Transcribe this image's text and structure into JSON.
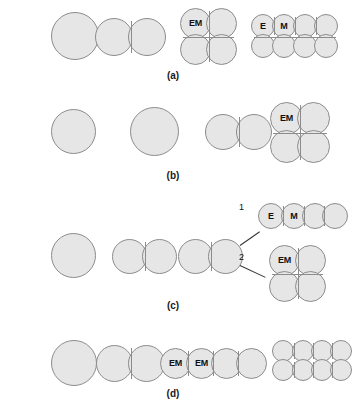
{
  "figure": {
    "background_color": "#ffffff",
    "cell_fill_color": "#e6e6e6",
    "cell_stroke_color": "#8c8c8c",
    "label_text_color": "#111111"
  },
  "rows": [
    {
      "caption": "(a)",
      "stages": [
        {
          "name": "one-cell",
          "labels": []
        },
        {
          "name": "two-cell",
          "labels": []
        },
        {
          "name": "four-cell-quad",
          "labels": [
            "EM"
          ]
        },
        {
          "name": "eight-cell-cluster",
          "labels": [
            "E",
            "M"
          ]
        }
      ]
    },
    {
      "caption": "(b)",
      "stages": [
        {
          "name": "one-cell",
          "labels": []
        },
        {
          "name": "one-cell",
          "labels": []
        },
        {
          "name": "two-cell",
          "labels": []
        },
        {
          "name": "four-cell-quad",
          "labels": [
            "EM"
          ]
        }
      ]
    },
    {
      "caption": "(c)",
      "stages": [
        {
          "name": "one-cell",
          "labels": []
        },
        {
          "name": "two-cell",
          "labels": []
        },
        {
          "name": "two-cell-branching",
          "labels": []
        },
        {
          "name": "branch-1-four-in-row",
          "labels": [
            "E",
            "M"
          ]
        },
        {
          "name": "branch-2-four-cell-quad",
          "labels": [
            "EM"
          ]
        }
      ],
      "branch_labels": [
        "1",
        "2"
      ]
    },
    {
      "caption": "(d)",
      "stages": [
        {
          "name": "one-cell",
          "labels": []
        },
        {
          "name": "two-cell",
          "labels": []
        },
        {
          "name": "four-in-row",
          "labels": [
            "EM",
            "EM"
          ]
        },
        {
          "name": "eight-cell-cluster",
          "labels": []
        }
      ]
    }
  ],
  "labels": {
    "row_a": "(a)",
    "row_b": "(b)",
    "row_c": "(c)",
    "row_d": "(d)",
    "em": "EM",
    "e": "E",
    "m": "M",
    "branch_one": "1",
    "branch_two": "2"
  }
}
